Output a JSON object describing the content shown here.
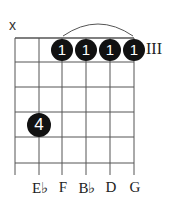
{
  "chord": {
    "strings": 6,
    "frets_shown": 5,
    "position_label": "III",
    "muted_marker": "x",
    "barre": {
      "from_string": 3,
      "to_string": 6,
      "fret": 1,
      "finger": "1"
    },
    "fingers": [
      {
        "string": 3,
        "fret": 1,
        "label": "1"
      },
      {
        "string": 4,
        "fret": 1,
        "label": "1"
      },
      {
        "string": 5,
        "fret": 1,
        "label": "1"
      },
      {
        "string": 6,
        "fret": 1,
        "label": "1"
      },
      {
        "string": 2,
        "fret": 4,
        "label": "4"
      }
    ],
    "note_labels": [
      "",
      "E♭",
      "F",
      "B♭",
      "D",
      "G"
    ],
    "colors": {
      "dot": "#111111",
      "line": "#444444",
      "text": "#222222"
    }
  }
}
